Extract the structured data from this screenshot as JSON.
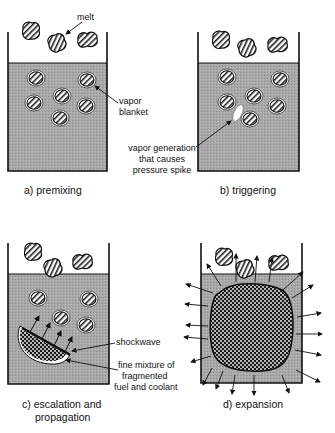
{
  "diagram": {
    "panels": [
      {
        "id": "a",
        "caption": "a) premixing"
      },
      {
        "id": "b",
        "caption": "b) triggering"
      },
      {
        "id": "c",
        "caption_line1": "c) escalation and",
        "caption_line2": "propagation"
      },
      {
        "id": "d",
        "caption": "d) expansion"
      }
    ],
    "labels": {
      "melt": "melt",
      "vapor_blanket_1": "vapor",
      "vapor_blanket_2": "blanket",
      "vapor_gen_1": "vapor  generation",
      "vapor_gen_2": "that causes",
      "vapor_gen_3": "pressure spike",
      "shockwave": "shockwave",
      "fine_mix_1": "fine mixture of",
      "fine_mix_2": "fragmented",
      "fine_mix_3": "fuel and coolant"
    },
    "colors": {
      "coolant": "#a9a9a9",
      "outline": "#111111",
      "background": "#ffffff"
    }
  }
}
